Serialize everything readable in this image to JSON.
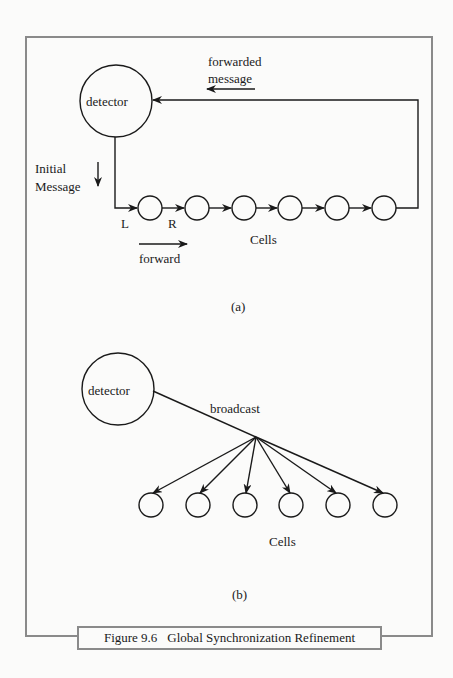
{
  "figure": {
    "number": "Figure 9.6",
    "title": "Global Synchronization Refinement"
  },
  "panel_a": {
    "sublabel": "(a)",
    "detector_label": "detector",
    "forwarded_label_line1": "forwarded",
    "forwarded_label_line2": "message",
    "initial_label_line1": "Initial",
    "initial_label_line2": "Message",
    "left_port": "L",
    "right_port": "R",
    "cells_label": "Cells",
    "forward_label": "forward",
    "cell_count": 6
  },
  "panel_b": {
    "sublabel": "(b)",
    "detector_label": "detector",
    "broadcast_label": "broadcast",
    "cells_label": "Cells",
    "cell_count": 6
  },
  "colors": {
    "frame": "#8a8a8a",
    "ink": "#1a1a1a",
    "paper": "#fbfbfa"
  }
}
